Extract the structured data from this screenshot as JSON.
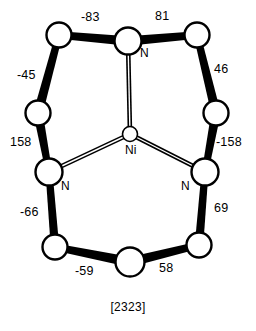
{
  "figure": {
    "caption": "[2323]",
    "central_atom_label": "Ni",
    "colors": {
      "background": "#ffffff",
      "stroke": "#000000",
      "atom_fill": "#ffffff"
    }
  },
  "atoms": [
    {
      "id": "ni",
      "label": "Ni",
      "element": "Ni",
      "cx": 130,
      "cy": 134,
      "r": 7.5,
      "label_dx": 0,
      "label_dy": 16
    },
    {
      "id": "n-top",
      "label": "N",
      "element": "N",
      "cx": 128,
      "cy": 41,
      "r": 13.5,
      "label_dx": 17,
      "label_dy": 12
    },
    {
      "id": "n-left",
      "label": "N",
      "element": "N",
      "cx": 49,
      "cy": 172,
      "r": 13.5,
      "label_dx": 17,
      "label_dy": 14
    },
    {
      "id": "n-right",
      "label": "N",
      "element": "N",
      "cx": 205,
      "cy": 172,
      "r": 13.5,
      "label_dx": -19,
      "label_dy": 14
    },
    {
      "id": "c-top-left",
      "label": "",
      "element": "C",
      "cx": 59,
      "cy": 35,
      "r": 12.5
    },
    {
      "id": "c-top-right",
      "label": "",
      "element": "C",
      "cx": 197,
      "cy": 35,
      "r": 12.5
    },
    {
      "id": "c-mid-left",
      "label": "",
      "element": "C",
      "cx": 38,
      "cy": 113,
      "r": 12.5
    },
    {
      "id": "c-mid-right",
      "label": "",
      "element": "C",
      "cx": 216,
      "cy": 113,
      "r": 12.5
    },
    {
      "id": "c-bottom-left",
      "label": "",
      "element": "C",
      "cx": 55,
      "cy": 247,
      "r": 12.5
    },
    {
      "id": "c-bottom-mid",
      "label": "",
      "element": "C",
      "cx": 130,
      "cy": 262,
      "r": 14.5
    },
    {
      "id": "c-bottom-right",
      "label": "",
      "element": "C",
      "cx": 199,
      "cy": 245,
      "r": 12.5
    }
  ],
  "bonds": [
    {
      "id": "bond-tl-ntop",
      "from": "c-top-left",
      "to": "n-top",
      "style": "thick",
      "w1": 7.5,
      "w2": 9.5
    },
    {
      "id": "bond-ntop-tr",
      "from": "n-top",
      "to": "c-top-right",
      "style": "thick",
      "w1": 9.5,
      "w2": 7.5
    },
    {
      "id": "bond-tl-ml",
      "from": "c-top-left",
      "to": "c-mid-left",
      "style": "thick",
      "w1": 7.0,
      "w2": 9.5
    },
    {
      "id": "bond-tr-mr",
      "from": "c-top-right",
      "to": "c-mid-right",
      "style": "thick",
      "w1": 7.0,
      "w2": 9.5
    },
    {
      "id": "bond-ml-nleft",
      "from": "c-mid-left",
      "to": "n-left",
      "style": "thick",
      "w1": 9.5,
      "w2": 6.5
    },
    {
      "id": "bond-mr-nright",
      "from": "c-mid-right",
      "to": "n-right",
      "style": "thick",
      "w1": 9.5,
      "w2": 6.5
    },
    {
      "id": "bond-nleft-bl",
      "from": "n-left",
      "to": "c-bottom-left",
      "style": "thick",
      "w1": 7.0,
      "w2": 8.5
    },
    {
      "id": "bond-nright-br",
      "from": "n-right",
      "to": "c-bottom-right",
      "style": "thick",
      "w1": 7.0,
      "w2": 8.5
    },
    {
      "id": "bond-bl-bm",
      "from": "c-bottom-left",
      "to": "c-bottom-mid",
      "style": "thick",
      "w1": 7.0,
      "w2": 10.0
    },
    {
      "id": "bond-bm-br",
      "from": "c-bottom-mid",
      "to": "c-bottom-right",
      "style": "thick",
      "w1": 10.0,
      "w2": 7.0
    },
    {
      "id": "bond-ni-ntop",
      "from": "ni",
      "to": "n-top",
      "style": "double",
      "gap": 3.0
    },
    {
      "id": "bond-ni-nleft",
      "from": "ni",
      "to": "n-left",
      "style": "double",
      "gap": 3.0
    },
    {
      "id": "bond-ni-nright",
      "from": "ni",
      "to": "n-right",
      "style": "double",
      "gap": 3.0
    }
  ],
  "torsion_angles": [
    {
      "id": "torsion-top-left",
      "value": "-83",
      "bond": "bond-tl-ntop",
      "x": 81,
      "y": 11
    },
    {
      "id": "torsion-top-right",
      "value": "81",
      "bond": "bond-ntop-tr",
      "x": 155,
      "y": 10
    },
    {
      "id": "torsion-upper-left",
      "value": "-45",
      "bond": "bond-tl-ml",
      "x": 17,
      "y": 69
    },
    {
      "id": "torsion-upper-right",
      "value": "46",
      "bond": "bond-tr-mr",
      "x": 214,
      "y": 63
    },
    {
      "id": "torsion-lower-left",
      "value": "158",
      "bond": "bond-ml-nleft",
      "x": 10,
      "y": 136
    },
    {
      "id": "torsion-lower-right",
      "value": "-158",
      "bond": "bond-mr-nright",
      "x": 216,
      "y": 136
    },
    {
      "id": "torsion-bottom-left",
      "value": "-66",
      "bond": "bond-nleft-bl",
      "x": 20,
      "y": 206
    },
    {
      "id": "torsion-bottom-right",
      "value": "69",
      "bond": "bond-nright-br",
      "x": 214,
      "y": 202
    },
    {
      "id": "torsion-base-left",
      "value": "-59",
      "bond": "bond-bl-bm",
      "x": 75,
      "y": 265
    },
    {
      "id": "torsion-base-right",
      "value": "58",
      "bond": "bond-bm-br",
      "x": 159,
      "y": 262
    }
  ],
  "chart_data": {
    "type": "diagram",
    "subtitle": "",
    "annotations": [
      {
        "label": "-83",
        "position": "top-left edge"
      },
      {
        "label": "81",
        "position": "top-right edge"
      },
      {
        "label": "-45",
        "position": "upper-left edge"
      },
      {
        "label": "46",
        "position": "upper-right edge"
      },
      {
        "label": "158",
        "position": "mid-left edge"
      },
      {
        "label": "-158",
        "position": "mid-right edge"
      },
      {
        "label": "-66",
        "position": "lower-left edge"
      },
      {
        "label": "69",
        "position": "lower-right edge"
      },
      {
        "label": "-59",
        "position": "bottom-left edge"
      },
      {
        "label": "58",
        "position": "bottom-right edge"
      },
      {
        "label": "Ni",
        "position": "center"
      },
      {
        "label": "N",
        "position": "top donor"
      },
      {
        "label": "N",
        "position": "left donor"
      },
      {
        "label": "N",
        "position": "right donor"
      },
      {
        "label": "[2323]",
        "position": "caption"
      }
    ],
    "xlabel": "",
    "ylabel": "",
    "grid": false,
    "legend": false
  }
}
